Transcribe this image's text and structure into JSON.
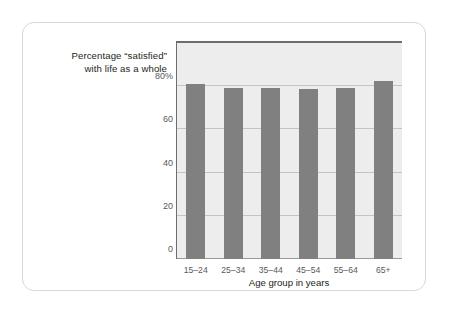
{
  "chart_data": {
    "type": "bar",
    "title": "",
    "subtitle": "",
    "ylabel_lines": [
      "Percentage “satisfied”",
      "with life as a whole"
    ],
    "xlabel": "Age group in years",
    "categories": [
      "15–24",
      "25–34",
      "35–44",
      "45–54",
      "55–64",
      "65+"
    ],
    "values": [
      81,
      79,
      79,
      78.5,
      79,
      82.5
    ],
    "ylim": [
      0,
      100
    ],
    "yticks": [
      0,
      20,
      40,
      60,
      80
    ],
    "ytick_labels": [
      "0",
      "20",
      "40",
      "60",
      "80%"
    ],
    "grid": true,
    "legend": "none",
    "bar_color": "#808080",
    "plot_background": "#ededed",
    "gridline_color": "#c4c4c4",
    "axis_color": "#6d6d6d",
    "card_border_color": "#d8d8d8",
    "page_background": "#ffffff",
    "text_color": "#231f20",
    "tick_text_color": "#58595b"
  }
}
